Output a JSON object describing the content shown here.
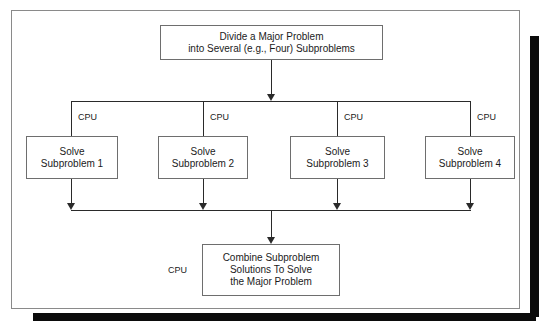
{
  "diagram": {
    "colors": {
      "line": "#2a2a2a",
      "box_border": "#6e6e6e",
      "frame_border": "#8a8a8a",
      "shadow": "#0b0b0b",
      "background": "#ffffff",
      "text": "#1b1b1b"
    },
    "top_box": {
      "line1": "Divide a Major Problem",
      "line2": "into Several (e.g., Four) Subproblems"
    },
    "subproblems": [
      {
        "line1": "Solve",
        "line2": "Subproblem 1",
        "cpu_label": "CPU"
      },
      {
        "line1": "Solve",
        "line2": "Subproblem 2",
        "cpu_label": "CPU"
      },
      {
        "line1": "Solve",
        "line2": "Subproblem 3",
        "cpu_label": "CPU"
      },
      {
        "line1": "Solve",
        "line2": "Subproblem 4",
        "cpu_label": "CPU"
      }
    ],
    "bottom_box": {
      "line1": "Combine Subproblem",
      "line2": "Solutions To Solve",
      "line3": "the Major Problem",
      "cpu_label": "CPU"
    }
  }
}
